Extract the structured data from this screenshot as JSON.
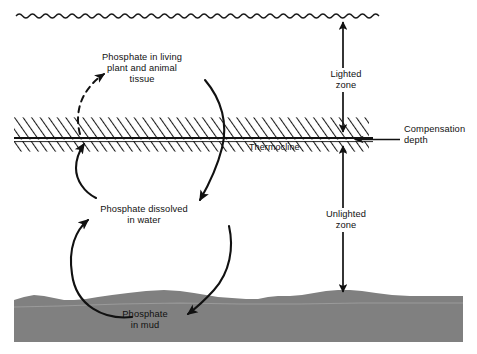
{
  "figure": {
    "type": "labeled-cross-section-diagram"
  },
  "colors": {
    "background": "#ffffff",
    "ink": "#111111",
    "mud_fill": "#808080",
    "hatch_band_fill": "#ffffff",
    "hatch_line": "#1a1a1a"
  },
  "labels": {
    "living_tissue": "Phosphate in living\nplant and animal\ntissue",
    "dissolved": "Phosphate dissolved\nin water",
    "mud": "Phosphate\nin mud",
    "thermocline": "Thermocline",
    "lighted_zone": "Lighted\nzone",
    "unlighted_zone": "Unlighted\nzone",
    "compensation_depth": "Compensation\ndepth"
  },
  "features": {
    "water_surface": "wavy-line",
    "thermocline_band": "diagonal-hatched-band",
    "compensation_depth_line": "solid-horizontal-line",
    "seafloor": "gray-mud-layer"
  },
  "arrows": [
    {
      "name": "mud-to-dissolved",
      "style": "solid",
      "from": "Phosphate in mud",
      "to": "Phosphate dissolved in water",
      "direction": "up"
    },
    {
      "name": "dissolved-to-tissue",
      "style": "solid-then-dashed",
      "from": "Phosphate dissolved in water",
      "to": "Phosphate in living plant and animal tissue",
      "direction": "up"
    },
    {
      "name": "tissue-to-dissolved",
      "style": "solid",
      "from": "Phosphate in living plant and animal tissue",
      "to": "Phosphate dissolved in water",
      "direction": "down"
    },
    {
      "name": "dissolved-to-mud",
      "style": "solid",
      "from": "Phosphate dissolved in water",
      "to": "Phosphate in mud",
      "direction": "down"
    },
    {
      "name": "lighted-zone-extent",
      "style": "double-headed",
      "direction": "vertical"
    },
    {
      "name": "unlighted-zone-extent",
      "style": "double-headed",
      "direction": "vertical"
    },
    {
      "name": "compensation-depth-pointer",
      "style": "single-headed",
      "direction": "left"
    }
  ]
}
